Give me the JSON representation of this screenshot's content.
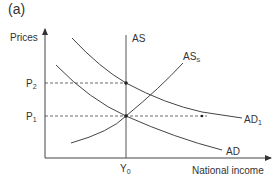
{
  "panel_label": "(a)",
  "axes": {
    "y_label": "Prices",
    "x_label": "National income"
  },
  "ticks": {
    "p2": {
      "base": "P",
      "sub": "2"
    },
    "p1": {
      "base": "P",
      "sub": "1"
    },
    "y0": {
      "base": "Y",
      "sub": "0"
    }
  },
  "curves": {
    "as": {
      "label": "AS"
    },
    "ass": {
      "base": "AS",
      "sub": "S"
    },
    "ad1": {
      "base": "AD",
      "sub": "1"
    },
    "ad": {
      "label": "AD"
    }
  },
  "colors": {
    "line": "#444444",
    "text": "#333333"
  }
}
